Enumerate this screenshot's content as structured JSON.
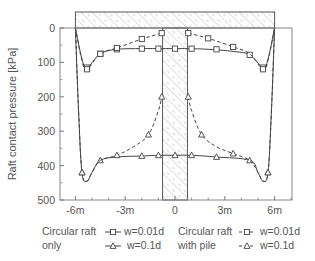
{
  "chart_data": {
    "type": "line",
    "title": "",
    "xlabel": "",
    "ylabel": "Raft contact pressure [kPa]",
    "x_tick_labels": [
      "-6m",
      "-3m",
      "0",
      "3m",
      "6m"
    ],
    "x_ticks": [
      -6,
      -3,
      0,
      3,
      6
    ],
    "y_tick_labels": [
      "0",
      "100",
      "200",
      "300",
      "400",
      "500"
    ],
    "y_ticks": [
      0,
      100,
      200,
      300,
      400,
      500
    ],
    "xlim": [
      -7,
      7
    ],
    "ylim": [
      500,
      0
    ],
    "y_inverted": true,
    "grid": false,
    "legend_position": "bottom",
    "annotations": [
      "hatched raft above plot from -6m to 6m",
      "hatched pile at center from -0.75m to 0.75m"
    ],
    "series": [
      {
        "name": "Circular raft only w=0.01d",
        "group": "Circular raft only",
        "label": "w=0.01d",
        "line": "solid",
        "marker": "square",
        "x": [
          -6.0,
          -5.6,
          -5.3,
          -4.5,
          -3.5,
          -2.0,
          -0.8,
          0.0,
          0.8,
          2.0,
          3.5,
          4.5,
          5.3,
          5.6,
          6.0
        ],
        "y": [
          0,
          90,
          115,
          75,
          62,
          60,
          60,
          60,
          60,
          62,
          68,
          78,
          115,
          90,
          0
        ],
        "marker_x": [
          -5.3,
          -4.5,
          -3.5,
          -2.0,
          -1.0,
          0.0,
          1.0,
          2.5,
          4.5,
          5.3
        ],
        "marker_y": [
          115,
          75,
          62,
          60,
          60,
          60,
          60,
          62,
          78,
          115
        ]
      },
      {
        "name": "Circular raft with pile w=0.01d",
        "group": "Circular raft with pile",
        "label": "w=0.01d",
        "line": "dashed",
        "marker": "square",
        "x": [
          -6.0,
          -5.6,
          -5.3,
          -4.5,
          -3.5,
          -2.0,
          -0.8,
          0.8,
          2.0,
          3.5,
          4.5,
          5.3,
          5.6,
          6.0
        ],
        "y": [
          0,
          95,
          120,
          75,
          58,
          32,
          15,
          15,
          30,
          55,
          75,
          120,
          95,
          0
        ],
        "marker_x": [
          -5.3,
          -4.5,
          -3.5,
          -2.0,
          -0.8,
          0.8,
          2.0,
          3.5,
          5.3
        ],
        "marker_y": [
          120,
          75,
          58,
          32,
          15,
          15,
          30,
          55,
          120
        ]
      },
      {
        "name": "Circular raft only w=0.1d",
        "group": "Circular raft only",
        "label": "w=0.1d",
        "line": "solid",
        "marker": "triangle",
        "x": [
          -6.0,
          -5.8,
          -5.6,
          -5.3,
          -5.0,
          -4.5,
          -3.5,
          -2.0,
          -1.0,
          0.0,
          1.0,
          2.5,
          4.5,
          5.0,
          5.3,
          5.6,
          5.8,
          6.0
        ],
        "y": [
          0,
          250,
          420,
          445,
          420,
          385,
          375,
          372,
          370,
          370,
          370,
          375,
          385,
          420,
          445,
          420,
          250,
          0
        ],
        "marker_x": [
          -5.6,
          -4.5,
          -2.0,
          -1.0,
          0.0,
          1.0,
          2.5,
          4.5,
          5.6
        ],
        "marker_y": [
          420,
          385,
          372,
          370,
          370,
          370,
          375,
          385,
          420
        ]
      },
      {
        "name": "Circular raft with pile w=0.1d",
        "group": "Circular raft with pile",
        "label": "w=0.1d",
        "line": "dashed",
        "marker": "triangle",
        "x": [
          -6.0,
          -5.8,
          -5.6,
          -5.3,
          -5.0,
          -4.5,
          -3.5,
          -2.5,
          -1.6,
          -1.0,
          -0.8,
          0.8,
          1.0,
          1.6,
          2.5,
          3.5,
          4.5,
          5.0,
          5.3,
          5.6,
          5.8,
          6.0
        ],
        "y": [
          0,
          250,
          420,
          445,
          420,
          385,
          370,
          345,
          310,
          240,
          200,
          200,
          240,
          310,
          345,
          365,
          385,
          420,
          445,
          420,
          250,
          0
        ],
        "marker_x": [
          -5.6,
          -3.5,
          -1.6,
          -0.8,
          0.8,
          1.6,
          3.5,
          5.6
        ],
        "marker_y": [
          420,
          370,
          310,
          200,
          200,
          310,
          365,
          420
        ]
      }
    ]
  },
  "legend": {
    "group1_line1": "Circular raft",
    "group1_line2": "only",
    "group2_line1": "Circular raft",
    "group2_line2": "with pile",
    "entry_001d": "w=0.01d",
    "entry_01d": "w=0.1d"
  },
  "colors": {
    "axis": "#666666",
    "line": "#444444",
    "hatch": "#999999"
  }
}
